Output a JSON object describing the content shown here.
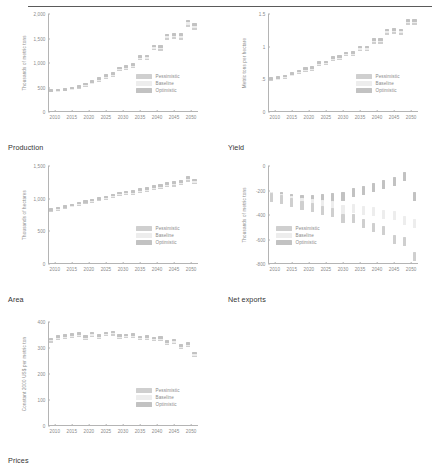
{
  "header": {
    "ghost_text": ""
  },
  "legend": {
    "series": [
      {
        "key": "pessimistic",
        "label": "Pessimistic",
        "color": "#cfcfcf"
      },
      {
        "key": "baseline",
        "label": "Baseline",
        "color": "#ededed"
      },
      {
        "key": "optimistic",
        "label": "Optimistic",
        "color": "#c2c2c2"
      }
    ]
  },
  "captions": {
    "production": "Production",
    "yield": "Yield",
    "area": "Area",
    "net_exports": "Net exports",
    "prices": "Prices"
  },
  "chart_data": [
    {
      "id": "production",
      "type": "scatter",
      "title": "Production",
      "xlabel": "",
      "ylabel": "Thousands of metric tons",
      "xlim": [
        2008,
        2052
      ],
      "ylim": [
        0,
        2000
      ],
      "yticks": [
        0,
        500,
        1000,
        1500,
        2000
      ],
      "ytick_labels": [
        "0",
        "500",
        "1,000",
        "1,500",
        "2,000"
      ],
      "xticks": [
        2010,
        2015,
        2020,
        2025,
        2030,
        2035,
        2040,
        2045,
        2050
      ],
      "xtick_labels": [
        "2010",
        "2015",
        "2020",
        "2025",
        "2030",
        "2035",
        "2040",
        "2045",
        "2050"
      ],
      "grid": false,
      "legend_position": "bottom-right",
      "x": [
        2009,
        2011,
        2013,
        2015,
        2017,
        2019,
        2021,
        2023,
        2025,
        2027,
        2029,
        2031,
        2033,
        2035,
        2037,
        2039,
        2041,
        2043,
        2045,
        2047,
        2049,
        2051
      ],
      "series": [
        {
          "name": "Pessimistic",
          "values": [
            425,
            430,
            450,
            470,
            500,
            545,
            590,
            640,
            700,
            740,
            855,
            880,
            920,
            1080,
            1090,
            1290,
            1280,
            1500,
            1510,
            1505,
            1760,
            1700
          ]
        },
        {
          "name": "Baseline",
          "values": [
            430,
            438,
            458,
            478,
            512,
            558,
            605,
            660,
            720,
            762,
            875,
            905,
            945,
            1105,
            1115,
            1320,
            1310,
            1540,
            1550,
            1545,
            1810,
            1745
          ]
        },
        {
          "name": "Optimistic",
          "values": [
            435,
            445,
            465,
            488,
            523,
            570,
            620,
            678,
            740,
            782,
            895,
            928,
            968,
            1128,
            1140,
            1350,
            1338,
            1575,
            1585,
            1580,
            1855,
            1790
          ]
        }
      ]
    },
    {
      "id": "yield",
      "type": "scatter",
      "title": "Yield",
      "xlabel": "",
      "ylabel": "Metric tons per hectare",
      "xlim": [
        2008,
        2052
      ],
      "ylim": [
        0,
        1.5
      ],
      "yticks": [
        0,
        0.5,
        1,
        1.5
      ],
      "ytick_labels": [
        "0",
        ".5",
        "1",
        "1.5"
      ],
      "xticks": [
        2010,
        2015,
        2020,
        2025,
        2030,
        2035,
        2040,
        2045,
        2050
      ],
      "xtick_labels": [
        "2010",
        "2015",
        "2020",
        "2025",
        "2030",
        "2035",
        "2040",
        "2045",
        "2050"
      ],
      "grid": false,
      "legend_position": "bottom-right",
      "x": [
        2009,
        2011,
        2013,
        2015,
        2017,
        2019,
        2021,
        2023,
        2025,
        2027,
        2029,
        2031,
        2033,
        2035,
        2037,
        2039,
        2041,
        2043,
        2045,
        2047,
        2049,
        2051
      ],
      "series": [
        {
          "name": "Pessimistic",
          "values": [
            0.5,
            0.505,
            0.53,
            0.565,
            0.6,
            0.635,
            0.655,
            0.725,
            0.735,
            0.8,
            0.815,
            0.87,
            0.875,
            0.955,
            0.955,
            1.065,
            1.065,
            1.205,
            1.215,
            1.205,
            1.355,
            1.355
          ]
        },
        {
          "name": "Baseline",
          "values": [
            0.508,
            0.515,
            0.542,
            0.578,
            0.614,
            0.65,
            0.67,
            0.742,
            0.752,
            0.818,
            0.834,
            0.888,
            0.894,
            0.976,
            0.976,
            1.088,
            1.088,
            1.23,
            1.24,
            1.23,
            1.382,
            1.382
          ]
        },
        {
          "name": "Optimistic",
          "values": [
            0.515,
            0.524,
            0.552,
            0.589,
            0.626,
            0.663,
            0.684,
            0.757,
            0.767,
            0.834,
            0.851,
            0.905,
            0.912,
            0.994,
            0.994,
            1.108,
            1.108,
            1.252,
            1.262,
            1.252,
            1.405,
            1.405
          ]
        }
      ]
    },
    {
      "id": "area",
      "type": "scatter",
      "title": "Area",
      "xlabel": "",
      "ylabel": "Thousands of hectares",
      "xlim": [
        2008,
        2052
      ],
      "ylim": [
        0,
        1500
      ],
      "yticks": [
        0,
        500,
        1000,
        1500
      ],
      "ytick_labels": [
        "0",
        "500",
        "1,000",
        "1,500"
      ],
      "xticks": [
        2010,
        2015,
        2020,
        2025,
        2030,
        2035,
        2040,
        2045,
        2050
      ],
      "xtick_labels": [
        "2010",
        "2015",
        "2020",
        "2025",
        "2030",
        "2035",
        "2040",
        "2045",
        "2050"
      ],
      "grid": false,
      "legend_position": "bottom-right",
      "x": [
        2009,
        2011,
        2013,
        2015,
        2017,
        2019,
        2021,
        2023,
        2025,
        2027,
        2029,
        2031,
        2033,
        2035,
        2037,
        2039,
        2041,
        2043,
        2045,
        2047,
        2049,
        2051
      ],
      "series": [
        {
          "name": "Pessimistic",
          "values": [
            820,
            838,
            860,
            885,
            910,
            935,
            955,
            980,
            1000,
            1030,
            1055,
            1072,
            1075,
            1110,
            1118,
            1155,
            1162,
            1195,
            1205,
            1222,
            1280,
            1245
          ]
        },
        {
          "name": "Baseline",
          "values": [
            828,
            847,
            870,
            896,
            921,
            947,
            968,
            993,
            1014,
            1045,
            1070,
            1088,
            1091,
            1127,
            1136,
            1173,
            1181,
            1215,
            1225,
            1243,
            1302,
            1266
          ]
        },
        {
          "name": "Optimistic",
          "values": [
            835,
            855,
            879,
            906,
            931,
            958,
            979,
            1005,
            1027,
            1058,
            1084,
            1103,
            1106,
            1143,
            1152,
            1190,
            1198,
            1233,
            1243,
            1262,
            1322,
            1285
          ]
        }
      ]
    },
    {
      "id": "net_exports",
      "type": "scatter",
      "title": "Net exports",
      "xlabel": "",
      "ylabel": "Thousands of metric tons",
      "xlim": [
        2008,
        2052
      ],
      "ylim": [
        -800,
        0
      ],
      "yticks": [
        0,
        -200,
        -400,
        -600,
        -800
      ],
      "ytick_labels": [
        "0",
        "-200",
        "-400",
        "-600",
        "-800"
      ],
      "xticks": [
        2010,
        2015,
        2020,
        2025,
        2030,
        2035,
        2040,
        2045,
        2050
      ],
      "xtick_labels": [
        "2010",
        "2015",
        "2020",
        "2025",
        "2030",
        "2035",
        "2040",
        "2045",
        "2050"
      ],
      "grid": false,
      "legend_position": "bottom-left",
      "x": [
        2009,
        2012,
        2015,
        2018,
        2021,
        2024,
        2027,
        2030,
        2033,
        2036,
        2039,
        2042,
        2045,
        2048,
        2051
      ],
      "series": [
        {
          "name": "Optimistic",
          "values": [
            -248,
            -252,
            -262,
            -272,
            -270,
            -268,
            -255,
            -250,
            -218,
            -200,
            -172,
            -148,
            -130,
            -82,
            -250
          ]
        },
        {
          "name": "Baseline",
          "values": [
            -252,
            -262,
            -280,
            -300,
            -305,
            -318,
            -320,
            -352,
            -348,
            -360,
            -372,
            -398,
            -402,
            -448,
            -470
          ]
        },
        {
          "name": "Pessimistic",
          "values": [
            -256,
            -272,
            -296,
            -325,
            -340,
            -362,
            -382,
            -430,
            -428,
            -470,
            -498,
            -530,
            -600,
            -618,
            -735
          ]
        }
      ]
    },
    {
      "id": "prices",
      "type": "scatter",
      "title": "Prices",
      "xlabel": "",
      "ylabel": "Constant 2000 US$ per metric ton",
      "xlim": [
        2008,
        2052
      ],
      "ylim": [
        0,
        400
      ],
      "yticks": [
        0,
        100,
        200,
        300,
        400
      ],
      "ytick_labels": [
        "0",
        "100",
        "200",
        "300",
        "400"
      ],
      "xticks": [
        2010,
        2015,
        2020,
        2025,
        2030,
        2035,
        2040,
        2045,
        2050
      ],
      "xtick_labels": [
        "2010",
        "2015",
        "2020",
        "2025",
        "2030",
        "2035",
        "2040",
        "2045",
        "2050"
      ],
      "grid": false,
      "legend_position": "bottom-right",
      "x": [
        2009,
        2011,
        2013,
        2015,
        2017,
        2019,
        2021,
        2023,
        2025,
        2027,
        2029,
        2031,
        2033,
        2035,
        2037,
        2039,
        2041,
        2043,
        2045,
        2047,
        2049,
        2051
      ],
      "series": [
        {
          "name": "Pessimistic",
          "values": [
            326,
            337,
            341,
            345,
            349,
            337,
            349,
            341,
            350,
            353,
            341,
            342,
            345,
            334,
            337,
            330,
            332,
            318,
            322,
            302,
            310,
            272
          ]
        },
        {
          "name": "Baseline",
          "values": [
            330,
            341,
            345,
            349,
            352,
            341,
            353,
            345,
            354,
            357,
            345,
            346,
            349,
            338,
            341,
            334,
            336,
            322,
            326,
            306,
            314,
            276
          ]
        },
        {
          "name": "Optimistic",
          "values": [
            334,
            345,
            349,
            352,
            356,
            345,
            357,
            349,
            358,
            361,
            349,
            350,
            353,
            342,
            345,
            338,
            340,
            326,
            330,
            310,
            318,
            280
          ]
        }
      ]
    }
  ]
}
